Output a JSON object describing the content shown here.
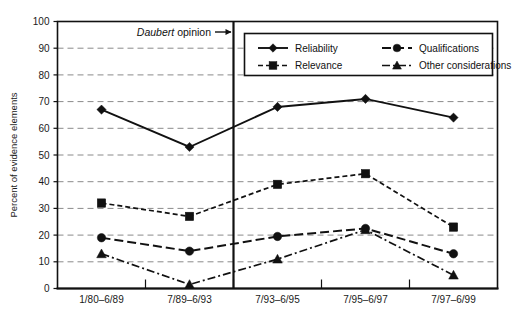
{
  "chart_data": {
    "type": "line",
    "title": "",
    "xlabel": "",
    "ylabel": "Percent of evidence elements",
    "ylim": [
      0,
      100
    ],
    "ytick_step": 10,
    "yticks": [
      "0",
      "10",
      "20",
      "30",
      "40",
      "50",
      "60",
      "70",
      "80",
      "90",
      "100"
    ],
    "grid": true,
    "legend_position": "top-right",
    "categories": [
      "1/80–6/89",
      "7/89–6/93",
      "7/93–6/95",
      "7/95–6/97",
      "7/97–6/99"
    ],
    "series": [
      {
        "name": "Reliability",
        "marker": "diamond",
        "linestyle": "solid",
        "values": [
          67,
          53,
          68,
          71,
          64
        ]
      },
      {
        "name": "Relevance",
        "marker": "square",
        "linestyle": "dashed",
        "values": [
          32,
          27,
          39,
          43,
          23
        ]
      },
      {
        "name": "Qualifications",
        "marker": "circle",
        "linestyle": "long-dash",
        "values": [
          19,
          14,
          19.5,
          22.5,
          13
        ]
      },
      {
        "name": "Other considerations",
        "marker": "triangle",
        "linestyle": "dash-dot",
        "values": [
          13,
          1.5,
          11,
          22,
          5
        ]
      }
    ],
    "annotations": [
      {
        "id": "daubert-opinion",
        "text_emphasis": "Daubert",
        "text_rest": " opinion",
        "arrow": "right",
        "marks_boundary_between": [
          "7/89–6/93",
          "7/93–6/95"
        ]
      }
    ],
    "colors": {
      "line": "#111111",
      "grid": "#8a8a8a",
      "background": "#ffffff",
      "text": "#1a1a1a"
    }
  }
}
